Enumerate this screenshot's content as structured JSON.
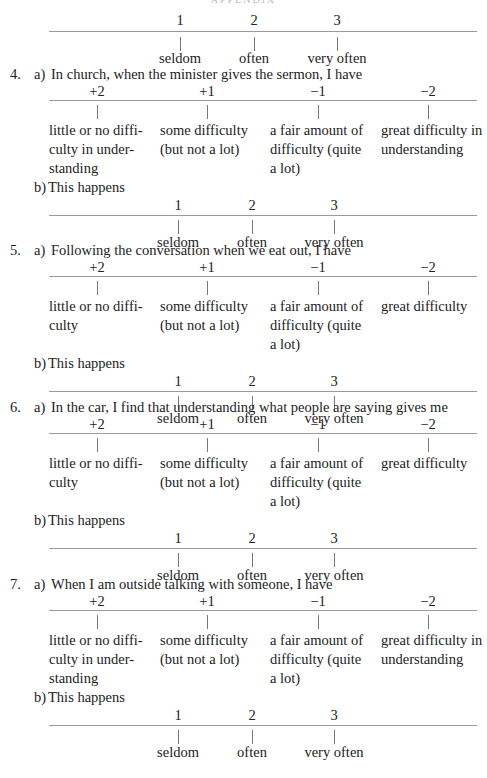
{
  "header": {
    "text": "APPENDIX"
  },
  "frequency_scale": {
    "numbers": [
      "1",
      "2",
      "3"
    ],
    "labels": [
      "seldom",
      "often",
      "very often"
    ]
  },
  "difficulty_scale": {
    "numbers": [
      "+2",
      "+1",
      "−1",
      "−2"
    ]
  },
  "top_scale": {
    "numbers": [
      "1",
      "2",
      "3"
    ],
    "labels": [
      "seldom",
      "often",
      "very often"
    ]
  },
  "questions": [
    {
      "number": "4.",
      "part_a": {
        "marker": "a)",
        "prompt": "In church, when the minister gives the sermon, I have",
        "options": [
          [
            "little or no diffi-",
            "culty in under-",
            "standing"
          ],
          [
            "some difficulty",
            "(but not a lot)"
          ],
          [
            "a fair amount of",
            "difficulty (quite",
            "a lot)"
          ],
          [
            "great difficulty in",
            "understanding"
          ]
        ]
      },
      "part_b": {
        "marker": "b)",
        "prompt": "This happens"
      }
    },
    {
      "number": "5.",
      "part_a": {
        "marker": "a)",
        "prompt": "Following the conversation when we eat out, I have",
        "options": [
          [
            "little or no diffi-",
            "culty"
          ],
          [
            "some difficulty",
            "(but not a lot)"
          ],
          [
            "a fair amount of",
            "difficulty (quite",
            "a lot)"
          ],
          [
            "great difficulty"
          ]
        ]
      },
      "part_b": {
        "marker": "b)",
        "prompt": "This happens"
      }
    },
    {
      "number": "6.",
      "part_a": {
        "marker": "a)",
        "prompt": "In the car, I find that understanding what people are saying gives me",
        "options": [
          [
            "little or no diffi-",
            "culty"
          ],
          [
            "some difficulty",
            "(but not a lot)"
          ],
          [
            "a fair amount of",
            "difficulty (quite",
            "a lot)"
          ],
          [
            "great difficulty"
          ]
        ]
      },
      "part_b": {
        "marker": "b)",
        "prompt": "This happens"
      }
    },
    {
      "number": "7.",
      "part_a": {
        "marker": "a)",
        "prompt": "When I am outside talking with someone, I have",
        "options": [
          [
            "little or no diffi-",
            "culty in under-",
            "standing"
          ],
          [
            "some difficulty",
            "(but not a lot)"
          ],
          [
            "a fair amount of",
            "difficulty (quite",
            "a lot)"
          ],
          [
            "great difficulty in",
            "understanding"
          ]
        ]
      },
      "part_b": {
        "marker": "b)",
        "prompt": "This happens"
      }
    }
  ]
}
